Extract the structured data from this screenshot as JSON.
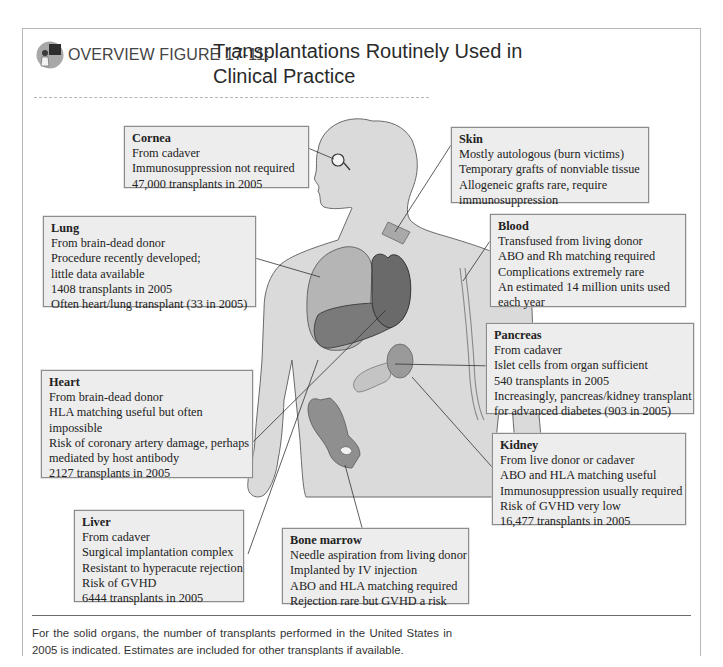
{
  "header": {
    "figure_label": "OVERVIEW FIGURE 17-11:",
    "title": "Transplantations Routinely Used in Clinical Practice",
    "icon": "teacher-icon"
  },
  "colors": {
    "box_fill": "#ededed",
    "box_border": "#8c8c8c",
    "body_fill": "#d9d9d9",
    "organ_light": "#b0b0b0",
    "organ_dark": "#6e6e6e",
    "rule": "#6b6b6b"
  },
  "callouts": {
    "cornea": {
      "title": "Cornea",
      "lines": [
        "From cadaver",
        "Immunosuppression not required",
        "47,000 transplants in 2005"
      ]
    },
    "skin": {
      "title": "Skin",
      "lines": [
        "Mostly autologous (burn victims)",
        "Temporary grafts of nonviable tissue",
        "Allogeneic grafts rare, require",
        "immunosuppression"
      ]
    },
    "lung": {
      "title": "Lung",
      "lines": [
        "From brain-dead donor",
        "Procedure recently developed;",
        "little data available",
        "1408 transplants in 2005",
        "Often heart/lung transplant (33 in 2005)"
      ]
    },
    "blood": {
      "title": "Blood",
      "lines": [
        "Transfused from living donor",
        "ABO and Rh matching required",
        "Complications extremely rare",
        "An estimated 14 million units used",
        "each year"
      ]
    },
    "pancreas": {
      "title": "Pancreas",
      "lines": [
        "From cadaver",
        "Islet cells from organ sufficient",
        "540 transplants in 2005",
        "Increasingly, pancreas/kidney transplant",
        "for advanced diabetes (903 in 2005)"
      ]
    },
    "heart": {
      "title": "Heart",
      "lines": [
        "From brain-dead donor",
        "HLA matching useful but often",
        "impossible",
        "Risk of coronary artery damage, perhaps",
        "mediated by host antibody",
        "2127 transplants in 2005"
      ]
    },
    "kidney": {
      "title": "Kidney",
      "lines": [
        "From live donor or cadaver",
        "ABO and HLA matching useful",
        "Immunosuppression usually required",
        "Risk of GVHD very low",
        "16,477 transplants in 2005"
      ]
    },
    "liver": {
      "title": "Liver",
      "lines": [
        "From cadaver",
        "Surgical implantation complex",
        "Resistant to hyperacute rejection",
        "Risk of GVHD",
        "6444 transplants in 2005"
      ]
    },
    "bone_marrow": {
      "title": "Bone marrow",
      "lines": [
        "Needle aspiration from living donor",
        "Implanted by IV injection",
        "ABO and HLA matching required",
        "Rejection rare but GVHD a risk"
      ]
    }
  },
  "footnote": "For the solid organs, the number of transplants performed in the United States in 2005 is indicated. Estimates are included for other transplants if available."
}
